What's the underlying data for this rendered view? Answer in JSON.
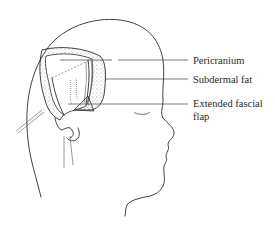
{
  "figure": {
    "labels": {
      "pericranium": "Pericranium",
      "subdermal_fat": "Subdermal fat",
      "extended_fascial_flap_line1": "Extended fascial",
      "extended_fascial_flap_line2": "flap"
    }
  }
}
